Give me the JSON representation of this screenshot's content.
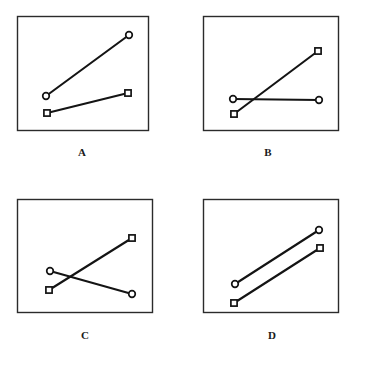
{
  "figure": {
    "title": "",
    "background_color": "#ffffff",
    "line_color": "#141414",
    "frame_color": "#2b2b2b",
    "marker_fill": "#ffffff",
    "label_color": "#1a1a1a",
    "width": 365,
    "height": 366
  },
  "chart_data": {
    "type": "line",
    "title": "",
    "xlabel": "",
    "ylabel": "",
    "x": [
      1,
      2
    ],
    "xlim": [
      0,
      3
    ],
    "ylim": [
      0,
      10
    ],
    "grid": false,
    "legend_position": "none",
    "axis_ticks_visible": false,
    "panels": [
      {
        "label": "A",
        "description": "Two non-parallel increasing lines that do not cross",
        "series": [
          {
            "name": "circle",
            "marker": "circle",
            "values": [
              4.0,
              8.4
            ]
          },
          {
            "name": "square",
            "marker": "square",
            "values": [
              2.6,
              4.5
            ]
          }
        ]
      },
      {
        "label": "B",
        "description": "Square line increases steeply and crosses a flat circle line",
        "series": [
          {
            "name": "circle",
            "marker": "circle",
            "values": [
              3.7,
              3.7
            ]
          },
          {
            "name": "square",
            "marker": "square",
            "values": [
              2.4,
              8.0
            ]
          }
        ]
      },
      {
        "label": "C",
        "description": "Circle line decreases and square line increases, crossing in an X",
        "series": [
          {
            "name": "circle",
            "marker": "circle",
            "values": [
              5.2,
              2.2
            ]
          },
          {
            "name": "square",
            "marker": "square",
            "values": [
              3.6,
              8.0
            ]
          }
        ]
      },
      {
        "label": "D",
        "description": "Two parallel increasing lines that do not cross",
        "series": [
          {
            "name": "circle",
            "marker": "circle",
            "values": [
              4.7,
              9.0
            ]
          },
          {
            "name": "square",
            "marker": "square",
            "values": [
              3.0,
              7.3
            ]
          }
        ]
      }
    ]
  },
  "panels": [
    {
      "id": "a",
      "label": "A",
      "frame": {
        "x": 17,
        "y": 16,
        "width": 131,
        "height": 114
      },
      "label_pos": {
        "x": 82,
        "y": 147
      },
      "lines": [
        {
          "marker": "circle",
          "points": [
            {
              "x": 46,
              "y": 96
            },
            {
              "x": 129,
              "y": 35
            }
          ]
        },
        {
          "marker": "square",
          "points": [
            {
              "x": 47,
              "y": 113
            },
            {
              "x": 128,
              "y": 93
            }
          ]
        }
      ]
    },
    {
      "id": "b",
      "label": "B",
      "frame": {
        "x": 203,
        "y": 16,
        "width": 135,
        "height": 114
      },
      "label_pos": {
        "x": 268,
        "y": 147
      },
      "lines": [
        {
          "marker": "circle",
          "points": [
            {
              "x": 233,
              "y": 99
            },
            {
              "x": 319,
              "y": 100
            }
          ]
        },
        {
          "marker": "square",
          "points": [
            {
              "x": 234,
              "y": 114
            },
            {
              "x": 318,
              "y": 51
            }
          ]
        }
      ]
    },
    {
      "id": "c",
      "label": "C",
      "frame": {
        "x": 17,
        "y": 199,
        "width": 135,
        "height": 113
      },
      "label_pos": {
        "x": 85,
        "y": 330
      },
      "lines": [
        {
          "marker": "circle",
          "points": [
            {
              "x": 50,
              "y": 271
            },
            {
              "x": 132,
              "y": 294
            }
          ]
        },
        {
          "marker": "square",
          "points": [
            {
              "x": 49,
              "y": 290
            },
            {
              "x": 132,
              "y": 238
            }
          ]
        }
      ]
    },
    {
      "id": "d",
      "label": "D",
      "frame": {
        "x": 203,
        "y": 199,
        "width": 135,
        "height": 113
      },
      "label_pos": {
        "x": 272,
        "y": 330
      },
      "lines": [
        {
          "marker": "circle",
          "points": [
            {
              "x": 235,
              "y": 284
            },
            {
              "x": 319,
              "y": 230
            }
          ]
        },
        {
          "marker": "square",
          "points": [
            {
              "x": 234,
              "y": 303
            },
            {
              "x": 320,
              "y": 248
            }
          ]
        }
      ]
    }
  ]
}
